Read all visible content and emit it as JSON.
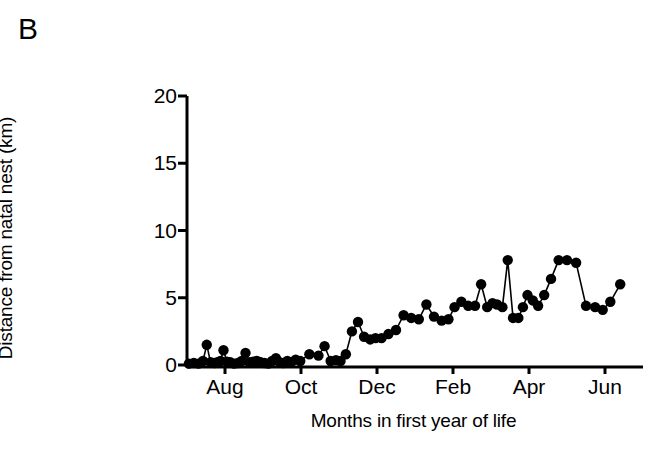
{
  "panel": {
    "label": "B"
  },
  "chart_data": {
    "type": "line",
    "title": "",
    "subtitle": "",
    "xlabel": "Months in first year of life",
    "ylabel": "Distance from natal nest (km)",
    "ylim": [
      0,
      20
    ],
    "yticks": [
      0,
      5,
      10,
      15,
      20
    ],
    "ytick_labels": [
      "0",
      "5",
      "10",
      "15",
      "20"
    ],
    "xlim": [
      0,
      12
    ],
    "xticks": [
      1,
      3,
      5,
      7,
      9,
      11
    ],
    "xtick_labels": [
      "Aug",
      "Oct",
      "Dec",
      "Feb",
      "Apr",
      "Jun"
    ],
    "grid": false,
    "legend": "none",
    "marker": "filled-circle",
    "marker_color": "#000000",
    "line_color": "#000000",
    "series": [
      {
        "name": "Distance from natal nest",
        "x": [
          0.05,
          0.18,
          0.3,
          0.42,
          0.52,
          0.62,
          0.72,
          0.8,
          0.88,
          0.96,
          1.05,
          1.14,
          1.24,
          1.34,
          1.44,
          1.54,
          1.64,
          1.74,
          1.84,
          1.94,
          2.04,
          2.14,
          2.24,
          2.34,
          2.44,
          2.54,
          2.64,
          2.74,
          2.86,
          2.98,
          3.22,
          3.46,
          3.62,
          3.78,
          3.92,
          4.04,
          4.18,
          4.34,
          4.5,
          4.66,
          4.82,
          4.96,
          5.12,
          5.3,
          5.5,
          5.7,
          5.9,
          6.1,
          6.3,
          6.5,
          6.7,
          6.88,
          7.04,
          7.22,
          7.4,
          7.58,
          7.74,
          7.9,
          8.04,
          8.16,
          8.3,
          8.44,
          8.58,
          8.72,
          8.84,
          8.96,
          9.1,
          9.24,
          9.4,
          9.58,
          9.78,
          10.0,
          10.24,
          10.5,
          10.74,
          10.94,
          11.14,
          11.4
        ],
        "y": [
          0.1,
          0.15,
          0.1,
          0.3,
          1.5,
          0.2,
          0.15,
          0.2,
          0.3,
          1.1,
          0.25,
          0.2,
          0.1,
          0.15,
          0.3,
          0.9,
          0.2,
          0.25,
          0.3,
          0.2,
          0.15,
          0.1,
          0.3,
          0.5,
          0.2,
          0.15,
          0.3,
          0.2,
          0.4,
          0.3,
          0.8,
          0.7,
          1.4,
          0.3,
          0.35,
          0.3,
          0.8,
          2.5,
          3.2,
          2.1,
          1.9,
          2.0,
          2.0,
          2.3,
          2.6,
          3.7,
          3.5,
          3.4,
          4.5,
          3.6,
          3.3,
          3.4,
          4.3,
          4.7,
          4.4,
          4.4,
          6.0,
          4.3,
          4.6,
          4.5,
          4.3,
          7.8,
          3.5,
          3.5,
          4.3,
          5.2,
          4.8,
          4.4,
          5.2,
          6.4,
          7.8,
          7.8,
          7.6,
          4.4,
          4.3,
          4.1,
          4.7,
          6.0
        ],
        "values_note": "Distance in km of a tracked individual from its natal nest across its first year of life"
      }
    ]
  }
}
